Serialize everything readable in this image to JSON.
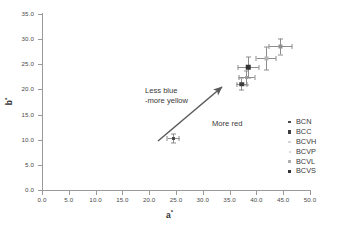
{
  "chart_data": {
    "type": "scatter",
    "title": "",
    "xlabel": "a*",
    "ylabel": "b*",
    "xlim": [
      0.0,
      50.0
    ],
    "ylim": [
      0.0,
      35.0
    ],
    "xticks": [
      "0.0",
      "5.0",
      "10.0",
      "15.0",
      "20.0",
      "25.0",
      "30.0",
      "35.0",
      "40.0",
      "45.0",
      "50.0"
    ],
    "yticks": [
      "0.0",
      "5.0",
      "10.0",
      "15.0",
      "20.0",
      "25.0",
      "30.0",
      "35.0"
    ],
    "xtick_values": [
      0,
      5,
      10,
      15,
      20,
      25,
      30,
      35,
      40,
      45,
      50
    ],
    "ytick_values": [
      0,
      5,
      10,
      15,
      20,
      25,
      30,
      35
    ],
    "grid": false,
    "legend_position": "right-inside",
    "series": [
      {
        "name": "BCN",
        "x": 24.5,
        "y": 10.3,
        "xerr": 1.1,
        "yerr": 0.9,
        "marker": "square",
        "marker_size": 3,
        "color": "#4a4a4a"
      },
      {
        "name": "BCC",
        "x": 37.3,
        "y": 21.0,
        "xerr": 1.0,
        "yerr": 1.2,
        "marker": "square",
        "marker_size": 4.5,
        "color": "#3c3c3c"
      },
      {
        "name": "BCVH",
        "x": 44.5,
        "y": 28.5,
        "xerr": 2.1,
        "yerr": 1.6,
        "marker": "square",
        "marker_size": 4,
        "color": "#8f8f8f"
      },
      {
        "name": "BCVP",
        "x": 41.8,
        "y": 26.1,
        "xerr": 1.8,
        "yerr": 2.3,
        "marker": "square",
        "marker_size": 4,
        "color": "#b4b4b4"
      },
      {
        "name": "BCVL",
        "x": 38.2,
        "y": 22.3,
        "xerr": 1.5,
        "yerr": 1.4,
        "marker": "square",
        "marker_size": 3,
        "color": "#a0a0a0"
      },
      {
        "name": "BCVS",
        "x": 38.5,
        "y": 24.4,
        "xerr": 2.0,
        "yerr": 2.1,
        "marker": "square",
        "marker_size": 5.5,
        "color": "#333333"
      }
    ],
    "annotations": [
      {
        "id": "less-blue",
        "line1": "Less blue",
        "line2": "-more yellow"
      },
      {
        "id": "more-red",
        "text": "More red"
      }
    ],
    "arrow": {
      "from": [
        26.0,
        11.5
      ],
      "to": [
        35.2,
        20.2
      ],
      "color": "#5a5a5a"
    }
  },
  "legend": {
    "entries": [
      {
        "label": "BCN",
        "color": "#4a4a4a",
        "size": 2.6
      },
      {
        "label": "BCC",
        "color": "#3c3c3c",
        "size": 3.6
      },
      {
        "label": "BCVH",
        "color": "#d4d4d4",
        "size": 2.2
      },
      {
        "label": "BCVP",
        "color": "#dcdcdc",
        "size": 2.0
      },
      {
        "label": "BCVL",
        "color": "#b0b0b0",
        "size": 2.2
      },
      {
        "label": "BCVS",
        "color": "#333333",
        "size": 3.4
      }
    ]
  },
  "axis_titles": {
    "x_base": "a",
    "x_sup": "*",
    "y_base": "b",
    "y_sup": "*"
  }
}
